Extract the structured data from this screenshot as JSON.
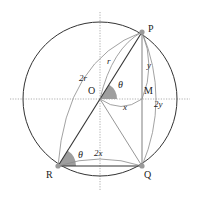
{
  "diagram": {
    "title": "",
    "points": {
      "P": "P",
      "Q": "Q",
      "R": "R",
      "O": "O",
      "M": "M"
    },
    "measures": {
      "r": "r",
      "two_r": "2r",
      "x": "x",
      "two_x": "2x",
      "y": "y",
      "two_y": "2y"
    },
    "angles": {
      "theta_at_O": "θ",
      "theta_at_R": "θ"
    },
    "colors": {
      "circle": "#333333",
      "dark_line": "#333333",
      "light_line": "#8a8a8a",
      "axis": "#9a9a9a",
      "angle_fill": "#9e9e9e",
      "point_fill": "#9a9a9a"
    }
  }
}
